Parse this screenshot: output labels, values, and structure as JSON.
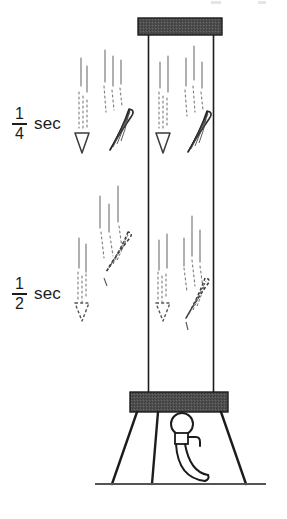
{
  "figure": {
    "width": 287,
    "height": 519,
    "background_color": "#ffffff",
    "ink_color": "#1c1c1c",
    "shade_color": "#4a4a4a"
  },
  "labels": [
    {
      "id": "quarter",
      "numerator": "1",
      "denominator": "4",
      "unit": "sec",
      "x": 12,
      "y": 106
    },
    {
      "id": "half",
      "numerator": "1",
      "denominator": "2",
      "unit": "sec",
      "x": 12,
      "y": 276
    }
  ],
  "apparatus": {
    "top_bar": {
      "x": 138,
      "y": 18,
      "width": 84,
      "height": 17,
      "fill": "#4a4a4a"
    },
    "base_bar": {
      "x": 130,
      "y": 392,
      "width": 98,
      "height": 20,
      "fill": "#4a4a4a"
    },
    "tube_left_wall_x": 148,
    "tube_right_wall_x": 214,
    "tube_top_y": 35,
    "tube_bottom_y": 392,
    "ground_line": {
      "x1": 95,
      "x2": 266,
      "y": 484
    },
    "legs": [
      {
        "x1": 137,
        "y1": 412,
        "x2": 112,
        "y2": 484
      },
      {
        "x1": 158,
        "y1": 412,
        "x2": 152,
        "y2": 484
      },
      {
        "x1": 221,
        "y1": 412,
        "x2": 246,
        "y2": 484
      }
    ],
    "knob": {
      "cx": 182,
      "cy": 424,
      "r": 11
    },
    "lever_description": "curved handle sweeping down and right to the ground"
  },
  "falling_objects": [
    {
      "id": "air-pellet-quarter",
      "kind": "pellet",
      "column": "air",
      "time": "1/4 sec",
      "x": 82,
      "y": 136,
      "style": "solid"
    },
    {
      "id": "air-feather-quarter",
      "kind": "feather",
      "column": "air",
      "time": "1/4 sec",
      "x": 112,
      "y": 120,
      "style": "solid"
    },
    {
      "id": "vac-pellet-quarter",
      "kind": "pellet",
      "column": "vacuum",
      "time": "1/4 sec",
      "x": 163,
      "y": 136,
      "style": "solid"
    },
    {
      "id": "vac-feather-quarter",
      "kind": "feather",
      "column": "vacuum",
      "time": "1/4 sec",
      "x": 196,
      "y": 120,
      "style": "solid"
    },
    {
      "id": "air-pellet-half",
      "kind": "pellet",
      "column": "air",
      "time": "1/2 sec",
      "x": 82,
      "y": 306,
      "style": "dashed"
    },
    {
      "id": "air-feather-half",
      "kind": "feather",
      "column": "air",
      "time": "1/2 sec",
      "x": 112,
      "y": 248,
      "style": "dashed"
    },
    {
      "id": "vac-pellet-half",
      "kind": "pellet",
      "column": "vacuum",
      "time": "1/2 sec",
      "x": 163,
      "y": 306,
      "style": "dashed"
    },
    {
      "id": "vac-feather-half",
      "kind": "feather",
      "column": "vacuum",
      "time": "1/2 sec",
      "x": 196,
      "y": 296,
      "style": "dashed"
    }
  ]
}
